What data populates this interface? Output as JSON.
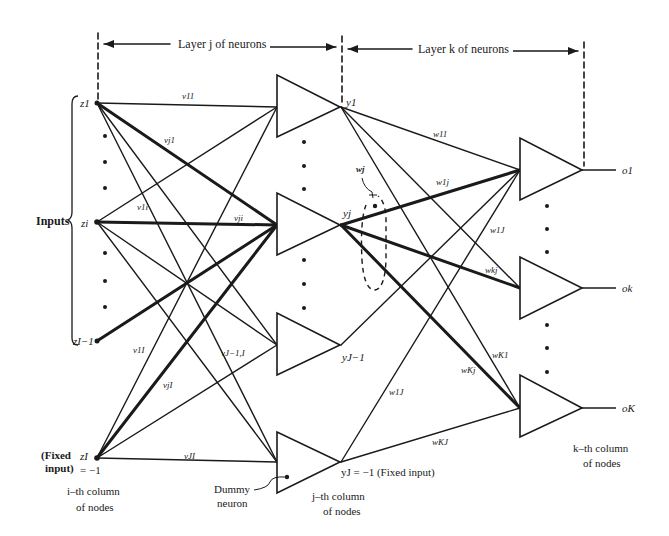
{
  "headers": {
    "layer_j": "Layer j of neurons",
    "layer_k": "Layer k of neurons"
  },
  "inputs": {
    "group_label": "Inputs",
    "nodes": [
      "z1",
      "zi",
      "zI−1",
      "zI"
    ],
    "fixed_input_label_line1": "(Fixed",
    "fixed_input_label_line2": "input)",
    "fixed_value": "= −1",
    "column_label_line1": "i–th column",
    "column_label_line2": "of nodes"
  },
  "hidden": {
    "outputs": [
      "y1",
      "yj",
      "yJ−1"
    ],
    "fixed_output": "yJ = −1  (Fixed input)",
    "dummy_label_line1": "Dummy",
    "dummy_label_line2": "neuron",
    "column_label_line1": "j–th column",
    "column_label_line2": "of nodes"
  },
  "output_layer": {
    "outputs": [
      "o1",
      "ok",
      "oK"
    ],
    "column_label_line1": "k–th column",
    "column_label_line2": "of nodes"
  },
  "weights_v": {
    "v11": "v11",
    "vj1": "vj1",
    "v1i": "v1i",
    "vji": "vji",
    "v1I": "v1I",
    "vJ-1,I": "vJ−1,I",
    "vjI": "vjI",
    "vJI": "vJI"
  },
  "weights_w": {
    "wj": "wj",
    "w11": "w11",
    "w1j": "w1j",
    "w1J": "w1J",
    "wkj": "wkj",
    "wK1": "wK1",
    "wKj": "wKj",
    "w1J_bottom": "w1J",
    "wKJ": "wKJ"
  }
}
